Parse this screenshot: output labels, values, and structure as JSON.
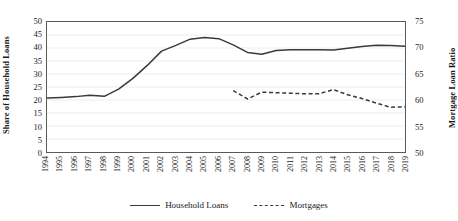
{
  "chart_data": {
    "type": "line",
    "title": "",
    "xlabel": "",
    "ylabel": "Share of Household Loans",
    "y2label": "Mortgage Loan Ratio",
    "categories": [
      "1994",
      "1995",
      "1996",
      "1997",
      "1998",
      "1999",
      "2000",
      "2001",
      "2002",
      "2003",
      "2004",
      "2005",
      "2006",
      "2007",
      "2008",
      "2009",
      "2010",
      "2011",
      "2012",
      "2013",
      "2014",
      "2015",
      "2016",
      "2017",
      "2018",
      "2019"
    ],
    "ylim": [
      0,
      50
    ],
    "yticks": [
      0,
      5,
      10,
      15,
      20,
      25,
      30,
      35,
      40,
      45,
      50
    ],
    "y2lim": [
      50,
      75
    ],
    "y2ticks": [
      50,
      55,
      60,
      65,
      70,
      75
    ],
    "grid": true,
    "legend_position": "bottom",
    "series": [
      {
        "name": "Household Loans",
        "axis": "left",
        "style": "solid",
        "color": "#3a3a3a",
        "values": [
          20.8,
          21.0,
          21.3,
          21.8,
          21.4,
          24.2,
          28.3,
          33.3,
          38.8,
          41.0,
          43.4,
          44.0,
          43.6,
          41.2,
          38.3,
          37.6,
          39.0,
          39.3,
          39.3,
          39.3,
          39.2,
          39.9,
          40.6,
          41.1,
          41.0,
          40.7
        ]
      },
      {
        "name": "Mortgages",
        "axis": "right",
        "style": "dashed",
        "color": "#3a3a3a",
        "values": [
          null,
          null,
          null,
          null,
          null,
          null,
          null,
          null,
          null,
          null,
          null,
          null,
          null,
          61.8,
          60.2,
          61.5,
          61.4,
          61.3,
          61.2,
          61.2,
          62.0,
          61.0,
          60.3,
          59.4,
          58.6,
          58.7
        ]
      }
    ]
  },
  "legend": {
    "items": [
      {
        "label": "Household Loans",
        "style": "solid"
      },
      {
        "label": "Mortgages",
        "style": "dashed"
      }
    ]
  }
}
